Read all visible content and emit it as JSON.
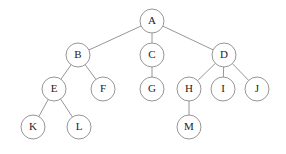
{
  "figure": {
    "name": "tree-diagram",
    "background_color": "#ffffff",
    "node_fill_color": "#ffffff",
    "node_stroke_color": "#8a8a8a",
    "edge_color": "#8a8a8a",
    "label_color": "#1c1c1c",
    "node_radius": 12
  },
  "nodes": [
    {
      "id": "A",
      "label": "A",
      "cx": 152,
      "cy": 21,
      "r": 12,
      "depth": 0
    },
    {
      "id": "B",
      "label": "B",
      "cx": 78,
      "cy": 55,
      "r": 12,
      "depth": 1
    },
    {
      "id": "C",
      "label": "C",
      "cx": 152,
      "cy": 55,
      "r": 12,
      "depth": 1
    },
    {
      "id": "D",
      "label": "D",
      "cx": 224,
      "cy": 55,
      "r": 12,
      "depth": 1
    },
    {
      "id": "E",
      "label": "E",
      "cx": 54,
      "cy": 89,
      "r": 12,
      "depth": 2
    },
    {
      "id": "F",
      "label": "F",
      "cx": 103,
      "cy": 89,
      "r": 12,
      "depth": 2
    },
    {
      "id": "G",
      "label": "G",
      "cx": 152,
      "cy": 89,
      "r": 12,
      "depth": 2
    },
    {
      "id": "H",
      "label": "H",
      "cx": 189,
      "cy": 89,
      "r": 12,
      "depth": 2
    },
    {
      "id": "I",
      "label": "I",
      "cx": 223,
      "cy": 89,
      "r": 12,
      "depth": 2
    },
    {
      "id": "J",
      "label": "J",
      "cx": 257,
      "cy": 89,
      "r": 12,
      "depth": 2
    },
    {
      "id": "K",
      "label": "K",
      "cx": 33,
      "cy": 127,
      "r": 12,
      "depth": 3
    },
    {
      "id": "L",
      "label": "L",
      "cx": 79,
      "cy": 127,
      "r": 12,
      "depth": 3
    },
    {
      "id": "M",
      "label": "M",
      "cx": 189,
      "cy": 127,
      "r": 12,
      "depth": 3
    }
  ],
  "edges": [
    {
      "from": "A",
      "to": "B"
    },
    {
      "from": "A",
      "to": "C"
    },
    {
      "from": "A",
      "to": "D"
    },
    {
      "from": "B",
      "to": "E"
    },
    {
      "from": "B",
      "to": "F"
    },
    {
      "from": "C",
      "to": "G"
    },
    {
      "from": "D",
      "to": "H"
    },
    {
      "from": "D",
      "to": "I"
    },
    {
      "from": "D",
      "to": "J"
    },
    {
      "from": "E",
      "to": "K"
    },
    {
      "from": "E",
      "to": "L"
    },
    {
      "from": "H",
      "to": "M"
    }
  ]
}
